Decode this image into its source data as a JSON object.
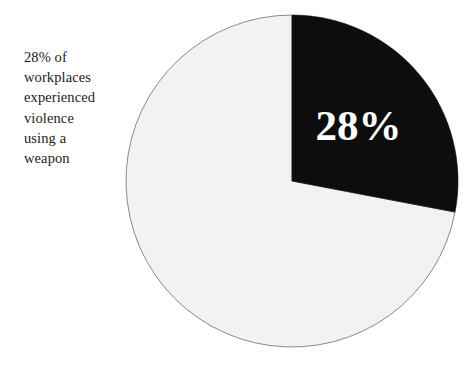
{
  "figure": {
    "background_color": "#ffffff",
    "caption": "28% of\nworkplaces\nexperienced\nviolence\nusing a\nweapon",
    "caption_lines": [
      "28% of",
      "workplaces",
      "experienced",
      "violence",
      "using a",
      "weapon"
    ],
    "slice_label": "28%"
  },
  "chart_data": {
    "type": "pie",
    "title": "",
    "subtitle": "",
    "xlabel": "",
    "ylabel": "",
    "grid": false,
    "legend": "none",
    "start_angle_deg": 0,
    "direction": "clockwise",
    "categories": [
      "Workplaces experiencing violence using a weapon",
      "Other workplaces"
    ],
    "values": [
      28,
      72
    ],
    "units": "percent",
    "labels": [
      "28%",
      ""
    ],
    "colors": [
      "#0d0d0d",
      "#f2f2f2"
    ],
    "label_colors": [
      "#ffffff",
      "#1a1a1a"
    ],
    "edge_color": "#808080",
    "annotations": [
      "28% of workplaces experienced violence using a weapon"
    ],
    "geometry": {
      "center_x": 292,
      "center_y": 181,
      "radius": 166
    }
  }
}
